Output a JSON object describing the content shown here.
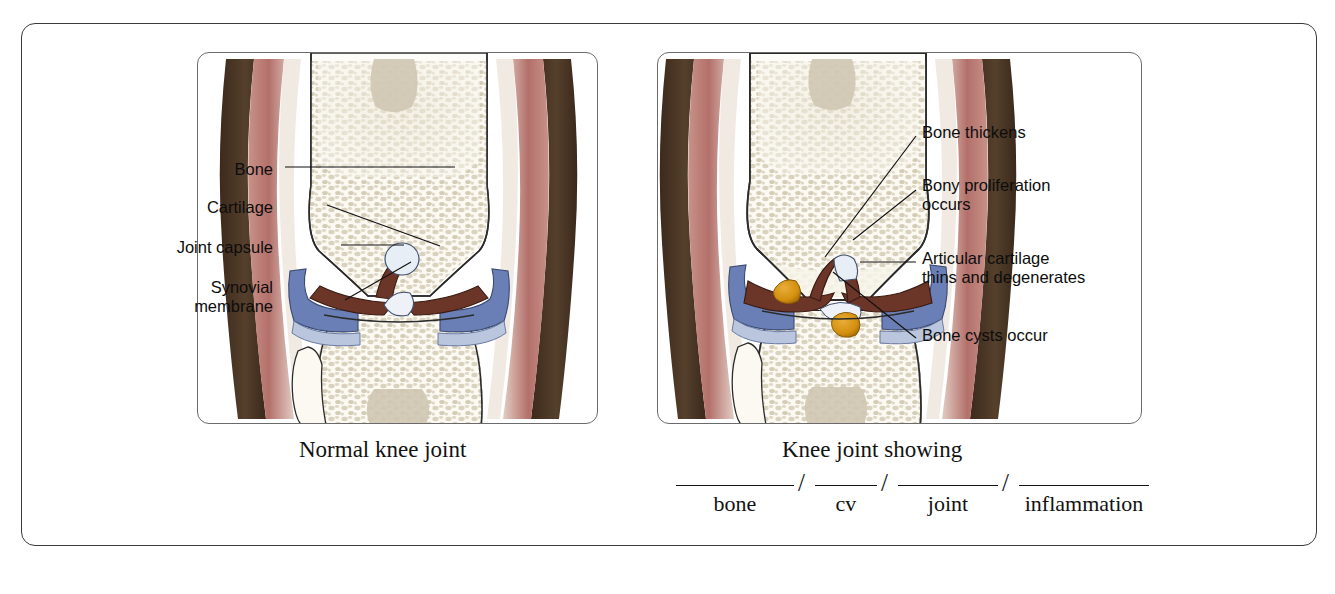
{
  "figure": {
    "panels": [
      {
        "id": "normal",
        "caption": "Normal knee joint",
        "labels": [
          {
            "text": "Bone",
            "name": "label-bone"
          },
          {
            "text": "Cartilage",
            "name": "label-cartilage"
          },
          {
            "text": "Joint capsule",
            "name": "label-joint-capsule"
          },
          {
            "text": "Synovial",
            "text2": "membrane",
            "name": "label-synovial-membrane"
          }
        ]
      },
      {
        "id": "osteoarthritic",
        "caption": "Knee joint showing",
        "labels": [
          {
            "text": "Bone thickens",
            "name": "label-bone-thickens"
          },
          {
            "text": "Bony proliferation",
            "text2": "occurs",
            "name": "label-bony-proliferation"
          },
          {
            "text": "Articular cartilage",
            "text2": "thins and degenerates",
            "name": "label-articular-cartilage"
          },
          {
            "text": "Bone cysts occur",
            "name": "label-bone-cysts"
          }
        ],
        "blanks": [
          {
            "word": "bone",
            "line_width": 118,
            "name": "blank-bone"
          },
          {
            "word": "cv",
            "line_width": 62,
            "name": "blank-cv"
          },
          {
            "word": "joint",
            "line_width": 100,
            "name": "blank-joint"
          },
          {
            "word": "inflammation",
            "line_width": 130,
            "name": "blank-inflammation"
          }
        ],
        "separator": "/"
      }
    ]
  },
  "colors": {
    "skin_dark": "#4a3423",
    "muscle_pink": "#b5736a",
    "muscle_light": "#d3a79b",
    "bone_outline": "#2b2b2b",
    "bone_cortical": "#fdfcf8",
    "bone_trabecular": "#d8d2c0",
    "cartilage_dark_brown": "#6b3528",
    "joint_capsule_blue": "#6a7fb5",
    "synovial_blue_light": "#b9c6de",
    "cyst_orange": "#d4900e",
    "frame_border": "#3a3a3a",
    "panel_border": "#6b6b6b",
    "text": "#0d0d0d"
  }
}
